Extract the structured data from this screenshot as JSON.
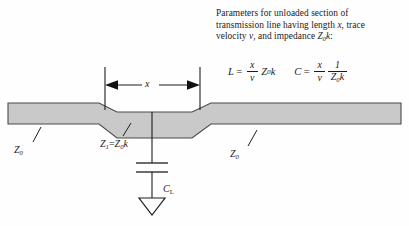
{
  "figure": {
    "background_color": "#fefefe",
    "trace_fill_color": "#c9c9c9",
    "line_color": "#1c1c1c"
  },
  "description": {
    "line1": "Parameters for unloaded section of",
    "line2_a": "transmission line having length ",
    "line2_x": "x",
    "line2_b": ", trace",
    "line3_a": "velocity ",
    "line3_v": "v",
    "line3_b": ", and impedance ",
    "line3_z": "Z",
    "line3_zsub": "0",
    "line3_k": "k",
    "line3_end": ":"
  },
  "equations": {
    "inductance": {
      "symbol": "L",
      "equals": "=",
      "numerator": "x",
      "denominator": "v",
      "multiplier": "Z",
      "multiplier_sub": "0",
      "multiplier_tail": "k"
    },
    "capacitance": {
      "symbol": "C",
      "equals": "=",
      "numerator": "x",
      "denominator": "v",
      "frac2_numerator": "1",
      "frac2_den_z": "Z",
      "frac2_den_sub": "0",
      "frac2_den_k": "k"
    }
  },
  "diagram": {
    "dimension_label": "x",
    "impedance_left": {
      "symbol": "Z",
      "sub": "0"
    },
    "impedance_middle": {
      "symbol": "Z",
      "sub": "1",
      "equals": "=",
      "value_symbol": "Z",
      "value_sub": "0",
      "value_k": "k"
    },
    "impedance_right": {
      "symbol": "Z",
      "sub": "0"
    },
    "capacitor_label": {
      "symbol": "C",
      "sub": "L"
    }
  }
}
